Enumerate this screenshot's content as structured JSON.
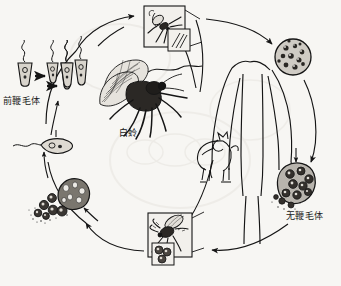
{
  "figure": {
    "type": "diagram",
    "background_color": "#f7f6f3",
    "ink_color": "#1a1a1a",
    "width": 341,
    "height": 286
  },
  "labels": {
    "promastigote": "前鞭毛体",
    "sandfly": "白蛉",
    "amastigote": "无鞭毛体"
  },
  "nodes": [
    {
      "id": "promastigote-series",
      "label": "前鞭毛体",
      "description": "four promastigote stages with dividing forms",
      "x": 10,
      "y": 60
    },
    {
      "id": "sandfly-illustration",
      "label": "白蛉",
      "description": "large detailed sandfly",
      "x": 100,
      "y": 60
    },
    {
      "id": "sandfly-inset-top",
      "label": "",
      "description": "sandfly feeding inset with magnified promastigotes",
      "x": 144,
      "y": 6
    },
    {
      "id": "infected-cell-top-right",
      "label": "",
      "description": "macrophage containing amastigotes",
      "x": 275,
      "y": 42
    },
    {
      "id": "human-host",
      "label": "",
      "description": "human torso and arms outline",
      "x": 225,
      "y": 62
    },
    {
      "id": "dog-host",
      "label": "",
      "description": "reservoir host dog",
      "x": 202,
      "y": 140
    },
    {
      "id": "infected-cell-bottom-right",
      "label": "无鞭毛体",
      "description": "macrophage bursting with amastigotes",
      "x": 283,
      "y": 158
    },
    {
      "id": "sandfly-inset-bottom",
      "label": "",
      "description": "sandfly biting inset with magnified amastigote cells",
      "x": 148,
      "y": 213
    },
    {
      "id": "ruptured-macrophage",
      "label": "",
      "description": "ruptured macrophage releasing amastigotes",
      "x": 40,
      "y": 180
    },
    {
      "id": "single-promastigote",
      "label": "",
      "description": "single promastigote with flagellum",
      "x": 40,
      "y": 140
    }
  ],
  "cycle_arrows": [
    {
      "from": "promastigote-series",
      "to": "sandfly-inset-top"
    },
    {
      "from": "sandfly-inset-top",
      "to": "infected-cell-top-right"
    },
    {
      "from": "infected-cell-top-right",
      "to": "infected-cell-bottom-right"
    },
    {
      "from": "infected-cell-bottom-right",
      "to": "sandfly-inset-bottom"
    },
    {
      "from": "sandfly-inset-bottom",
      "to": "ruptured-macrophage"
    },
    {
      "from": "ruptured-macrophage",
      "to": "single-promastigote"
    },
    {
      "from": "single-promastigote",
      "to": "promastigote-series"
    }
  ]
}
